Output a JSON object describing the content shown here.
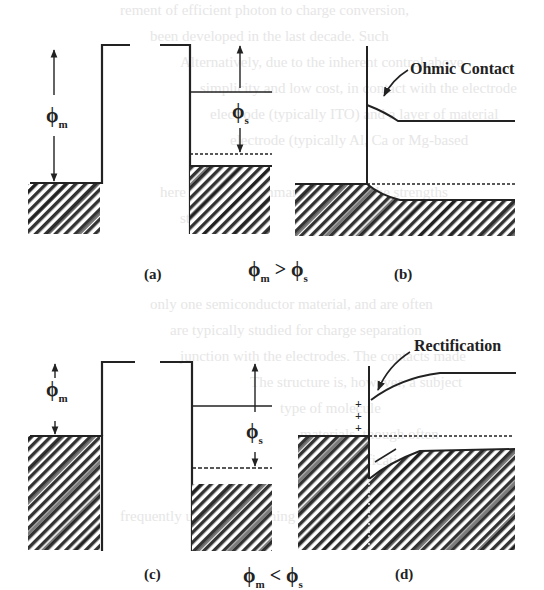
{
  "figure": {
    "panels": [
      {
        "id": "a",
        "label": "(a)",
        "phi_m_label": "ϕ",
        "phi_m_sub": "m",
        "phi_s_label": "ϕ",
        "phi_s_sub": "s"
      },
      {
        "id": "b",
        "label": "(b)",
        "annotation": "Ohmic Contact"
      },
      {
        "id": "c",
        "label": "(c)",
        "phi_m_label": "ϕ",
        "phi_m_sub": "m",
        "phi_s_label": "ϕ",
        "phi_s_sub": "s"
      },
      {
        "id": "d",
        "label": "(d)",
        "annotation": "Rectification",
        "charges": "+ + +"
      }
    ],
    "row_captions": [
      {
        "left": "ϕ",
        "left_sub": "m",
        "op": ">",
        "right": "ϕ",
        "right_sub": "s"
      },
      {
        "left": "ϕ",
        "left_sub": "m",
        "op": "<",
        "right": "ϕ",
        "right_sub": "s"
      }
    ],
    "background_text": [
      "rement of efficient photon to charge conversion,",
      "been developed in the last decade. Such",
      "Alternatively, due to the inherent control above",
      "simplicity and low cost, in contact with the electrode",
      "electrode (typically ITO) and a layer of material",
      "electrode (typically Al, Ca or Mg-based",
      "here follows a summary, including the strengths",
      "structures.",
      "only one semiconductor material, and are often",
      "are typically studied for charge separation",
      "junction with the electrodes. The contacts made",
      "The structure is, however, a subject",
      "type of molecule",
      "materials, though often",
      "rectification, as",
      "frequently used for screening and structural purposes"
    ]
  }
}
